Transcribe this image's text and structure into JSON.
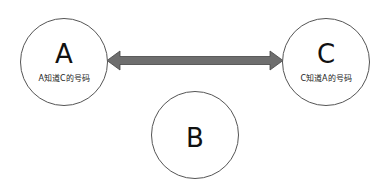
{
  "nodes": [
    {
      "id": "A",
      "label": "A",
      "caption": "A知道C的号码"
    },
    {
      "id": "B",
      "label": "B",
      "caption": ""
    },
    {
      "id": "C",
      "label": "C",
      "caption": "C知道A的号码"
    }
  ],
  "edges": [
    {
      "from": "A",
      "to": "C",
      "type": "bidirectional-arrow",
      "color": "#6e6e6e"
    }
  ]
}
